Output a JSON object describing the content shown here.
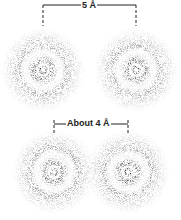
{
  "figure": {
    "top_pair": {
      "label": "5 Å",
      "atoms": [
        {
          "cx": 43,
          "cy": 70
        },
        {
          "cx": 136,
          "cy": 70
        }
      ],
      "bracket": {
        "x1": 43,
        "x2": 136,
        "y": 5
      }
    },
    "bottom_pair": {
      "label": "About 4 Å",
      "atoms": [
        {
          "cx": 54,
          "cy": 172
        },
        {
          "cx": 128,
          "cy": 172
        }
      ],
      "bracket": {
        "x1": 54,
        "x2": 128,
        "y": 124
      }
    },
    "colors": {
      "ink": "#222222",
      "background": "#ffffff"
    }
  }
}
